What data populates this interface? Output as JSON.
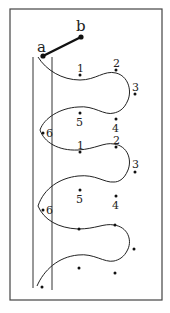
{
  "diagram": {
    "labels": {
      "a": "a",
      "b": "b",
      "row1": [
        "1",
        "2",
        "3"
      ],
      "row2": [
        "5",
        "4",
        "6"
      ],
      "row3": [
        "1",
        "2",
        "3"
      ],
      "row4": [
        "5",
        "4",
        "6"
      ]
    },
    "colors": {
      "ink": "#222222",
      "frame": "#444444",
      "background": "#ffffff"
    }
  }
}
